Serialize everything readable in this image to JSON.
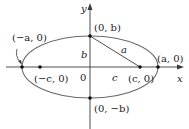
{
  "diagram": {
    "type": "ellipse-foci",
    "axes": {
      "x_label": "x",
      "y_label": "y",
      "origin_label": "0"
    },
    "points": {
      "top_vertex": "(0, b)",
      "bottom_vertex": "(0, −b)",
      "left_vertex": "(−a, 0)",
      "right_vertex": "(a, 0)",
      "left_focus": "(−c, 0)",
      "right_focus": "(c, 0)"
    },
    "segments": {
      "vertical_leg": "b",
      "hypotenuse": "a",
      "horizontal_leg": "c"
    },
    "colors": {
      "ellipse": "#6a6a6a",
      "axes": "#3a3a3a",
      "points": "#111111",
      "text": "#222222"
    }
  }
}
